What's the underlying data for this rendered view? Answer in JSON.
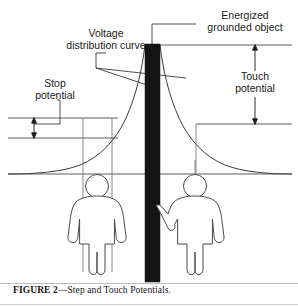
{
  "figure": {
    "caption_label": "FIGURE 2",
    "caption_dash": "—",
    "caption_text": "Step and Touch Potentials.",
    "caption_full": "FIGURE 2—Step and Touch Potentials."
  },
  "labels": {
    "voltage_curve_line1": "Voltage",
    "voltage_curve_line2": "distribution curve",
    "energized_line1": "Energized",
    "energized_line2": "grounded object",
    "stop_line1": "Stop",
    "stop_line2": "potential",
    "touch_line1": "Touch",
    "touch_line2": "potential"
  },
  "colors": {
    "ink": "#1a1a1a",
    "line": "#3a3a3a",
    "pole_fill": "#141414",
    "figure_stroke": "#4a4a4a",
    "ground_line": "#4a4a4a",
    "background": "#ffffff",
    "rule": "#bdbdbd"
  },
  "elements": {
    "pole_name": "energized-grounded-object",
    "curve_name": "voltage-distribution-curve",
    "left_person_name": "person-standing-step-potential",
    "right_person_name": "person-touching-grounded-object",
    "touch_arrow_name": "touch-potential-dimension-arrow",
    "step_arrow_name": "step-potential-dimension-arrow"
  }
}
